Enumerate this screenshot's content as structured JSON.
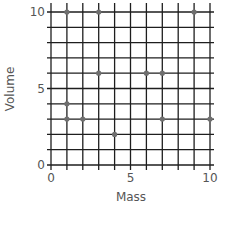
{
  "chart_data": {
    "type": "scatter",
    "title": "",
    "xlabel": "Mass",
    "ylabel": "Volume",
    "xlim": [
      0,
      10
    ],
    "ylim": [
      0,
      10
    ],
    "xticks": [
      0,
      5,
      10
    ],
    "yticks": [
      0,
      5,
      10
    ],
    "xtick_labels": [
      "0",
      "5",
      "10"
    ],
    "ytick_labels": [
      "0",
      "5",
      "10"
    ],
    "grid": true,
    "grid_step": 1,
    "legend": "none",
    "series": [
      {
        "name": "points",
        "color": "#6f6f6f",
        "points": [
          {
            "x": 1,
            "y": 10
          },
          {
            "x": 3,
            "y": 10
          },
          {
            "x": 9,
            "y": 10
          },
          {
            "x": 3,
            "y": 6
          },
          {
            "x": 6,
            "y": 6
          },
          {
            "x": 7,
            "y": 6
          },
          {
            "x": 1,
            "y": 4
          },
          {
            "x": 1,
            "y": 3
          },
          {
            "x": 2,
            "y": 3
          },
          {
            "x": 7,
            "y": 3
          },
          {
            "x": 10,
            "y": 3
          },
          {
            "x": 4,
            "y": 2
          }
        ]
      }
    ]
  }
}
